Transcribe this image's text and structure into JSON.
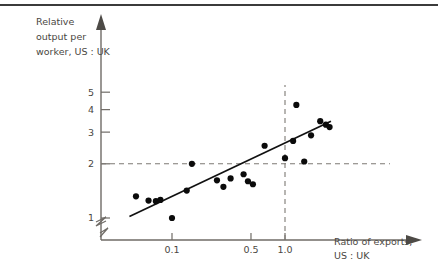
{
  "figure": {
    "background_color": "#ffffff",
    "ink_color": "#4a4742",
    "point_color": "#0b0b0b",
    "trend_color": "#111111",
    "guide_color": "#7d7974"
  },
  "chart_data": {
    "type": "scatter",
    "title": "",
    "subtitle": "",
    "ylabel": "Relative output per worker, US : UK",
    "ylabel_lines": [
      "Relative",
      "output per",
      "worker, US : UK"
    ],
    "xlabel": "Ratio of exports, US : UK",
    "xlabel_lines": [
      "Ratio of exports,",
      "US : UK"
    ],
    "xscale": "log",
    "yscale": "log",
    "xlim": [
      0.03,
      3.2
    ],
    "ylim": [
      0.85,
      6.2
    ],
    "grid": false,
    "legend": "none",
    "axis_break_y": true,
    "axis_break_x": true,
    "xticks": [
      {
        "value": 0.1,
        "label": "0.1"
      },
      {
        "value": 0.5,
        "label": "0.5"
      },
      {
        "value": 1.0,
        "label": "1.0"
      }
    ],
    "yticks": [
      {
        "value": 1,
        "label": "1"
      },
      {
        "value": 2,
        "label": "2"
      },
      {
        "value": 3,
        "label": "3"
      },
      {
        "value": 4,
        "label": "4"
      },
      {
        "value": 5,
        "label": "5"
      }
    ],
    "guides": [
      {
        "orientation": "horizontal",
        "value": 2.0,
        "style": "dashed",
        "label": "y = 2"
      },
      {
        "orientation": "vertical",
        "value": 1.0,
        "style": "dashed",
        "label": "x = 1.0"
      }
    ],
    "trendline": {
      "label": "fitted regression line",
      "x_start": 0.042,
      "y_start": 1.02,
      "x_end": 2.55,
      "y_end": 3.45
    },
    "points": [
      {
        "x": 0.048,
        "y": 1.32
      },
      {
        "x": 0.062,
        "y": 1.25
      },
      {
        "x": 0.072,
        "y": 1.24
      },
      {
        "x": 0.079,
        "y": 1.26
      },
      {
        "x": 0.1,
        "y": 1.0
      },
      {
        "x": 0.135,
        "y": 1.42
      },
      {
        "x": 0.15,
        "y": 2.0
      },
      {
        "x": 0.25,
        "y": 1.62
      },
      {
        "x": 0.285,
        "y": 1.49
      },
      {
        "x": 0.33,
        "y": 1.66
      },
      {
        "x": 0.43,
        "y": 1.75
      },
      {
        "x": 0.47,
        "y": 1.6
      },
      {
        "x": 0.52,
        "y": 1.54
      },
      {
        "x": 0.66,
        "y": 2.52
      },
      {
        "x": 1.0,
        "y": 2.15
      },
      {
        "x": 1.18,
        "y": 2.68
      },
      {
        "x": 1.26,
        "y": 4.25
      },
      {
        "x": 1.48,
        "y": 2.06
      },
      {
        "x": 1.7,
        "y": 2.88
      },
      {
        "x": 2.05,
        "y": 3.45
      },
      {
        "x": 2.3,
        "y": 3.3
      },
      {
        "x": 2.48,
        "y": 3.2
      }
    ]
  }
}
